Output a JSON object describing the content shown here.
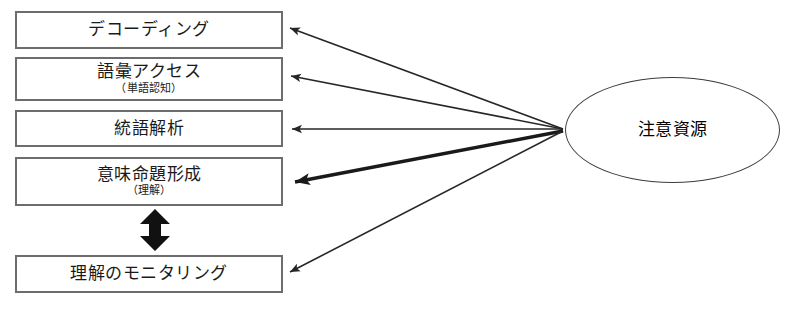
{
  "diagram": {
    "background_color": "#ffffff",
    "box_border_color": "#6d6d6d",
    "ellipse_border_color": "#3c3c3c",
    "arrow_color": "#262626",
    "processes": [
      {
        "id": "decoding",
        "label": "デコーディング",
        "sublabel": ""
      },
      {
        "id": "lexical",
        "label": "語彙アクセス",
        "sublabel": "（単語認知）"
      },
      {
        "id": "syntactic",
        "label": "統語解析",
        "sublabel": ""
      },
      {
        "id": "proposition",
        "label": "意味命題形成",
        "sublabel": "（理解）"
      },
      {
        "id": "monitoring",
        "label": "理解のモニタリング",
        "sublabel": ""
      }
    ],
    "resource": {
      "id": "attentional-resource",
      "label": "注意資源"
    },
    "links": [
      {
        "from": "attentional-resource",
        "to": "decoding",
        "weight": "thin",
        "direction": "one-way"
      },
      {
        "from": "attentional-resource",
        "to": "lexical",
        "weight": "thin",
        "direction": "one-way"
      },
      {
        "from": "attentional-resource",
        "to": "syntactic",
        "weight": "thin",
        "direction": "one-way"
      },
      {
        "from": "attentional-resource",
        "to": "proposition",
        "weight": "thick",
        "direction": "one-way"
      },
      {
        "from": "attentional-resource",
        "to": "monitoring",
        "weight": "thin",
        "direction": "one-way"
      },
      {
        "from": "proposition",
        "to": "monitoring",
        "weight": "thick",
        "direction": "two-way"
      }
    ]
  }
}
